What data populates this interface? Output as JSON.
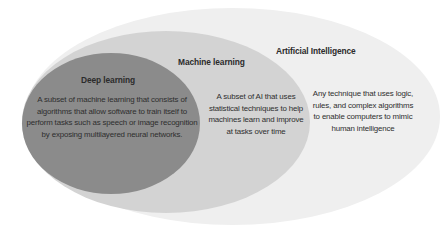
{
  "diagram": {
    "type": "nested-ellipses",
    "colors": {
      "background": "#ffffff",
      "artificial_intelligence": "#efefef",
      "machine_learning": "#d3d3d3",
      "deep_learning": "#8b8b8b",
      "text": "#2b2b2b"
    },
    "artificial_intelligence": {
      "title": "Artificial Intelligence",
      "description": "Any technique that uses logic, rules, and complex algorithms to enable computers to mimic human intelligence"
    },
    "machine_learning": {
      "title": "Machine learning",
      "description": "A subset of AI that uses statistical techniques to help machines learn and improve at tasks over time"
    },
    "deep_learning": {
      "title": "Deep learning",
      "description": "A subset of machine learning that consists of algorithms that allow software to train itself to perform tasks such as speech or image recognition by exposing multilayered neural networks."
    }
  }
}
